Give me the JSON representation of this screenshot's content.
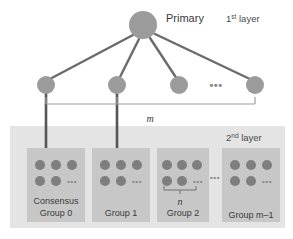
{
  "figure": {
    "title_label": "Primary",
    "layer1_label": "1",
    "layer1_sup": "st",
    "layer1_suffix": " layer",
    "layer2_label": "2",
    "layer2_sup": "nd",
    "layer2_suffix": " layer",
    "m_label": "m",
    "n_label": "n",
    "ellipsis": "•••",
    "ellipsis_small": "•••"
  },
  "colors": {
    "node_fill": "#9a9a9a",
    "node_stroke": "#8a8a8a",
    "edge": "#6b6b6b",
    "trunk": "#5a5a5a",
    "bracket": "#9a9a9a",
    "band_bg": "#e3e3e3",
    "group_bg": "#c6c6c6",
    "dot_fill": "#7e7e7e",
    "text": "#3a3a3a",
    "page_bg": "#ffffff"
  },
  "layer1": {
    "primary": {
      "label": "Primary",
      "cx": 143,
      "cy": 25,
      "r": 14
    },
    "nodes": [
      {
        "name": "node-0",
        "cx": 46,
        "cy": 85,
        "r": 9
      },
      {
        "name": "node-1",
        "cx": 117,
        "cy": 85,
        "r": 9
      },
      {
        "name": "node-2",
        "cx": 179,
        "cy": 85,
        "r": 9
      },
      {
        "name": "node-3",
        "cx": 255,
        "cy": 85,
        "r": 9
      }
    ],
    "ellipsis_x": 216,
    "ellipsis_y": 88
  },
  "layer2": {
    "band": {
      "x": 10,
      "y": 126,
      "w": 275,
      "h": 102
    },
    "groups": [
      {
        "name": "group-0",
        "x": 27,
        "y": 148,
        "w": 58,
        "h": 74,
        "label_lines": [
          "Consensus",
          "Group 0"
        ],
        "row1_dots": 3,
        "row2_dots": 2,
        "has_trunk": true,
        "trunk_x": 46,
        "has_n_brace": false
      },
      {
        "name": "group-1",
        "x": 92,
        "y": 148,
        "w": 58,
        "h": 74,
        "label_lines": [
          "Group 1"
        ],
        "row1_dots": 3,
        "row2_dots": 2,
        "has_trunk": true,
        "trunk_x": 117,
        "has_n_brace": false
      },
      {
        "name": "group-2",
        "x": 157,
        "y": 148,
        "w": 52,
        "h": 74,
        "label_lines": [
          "Group 2"
        ],
        "row1_dots": 3,
        "row2_dots": 2,
        "has_trunk": false,
        "trunk_x": 0,
        "has_n_brace": true
      },
      {
        "name": "group-m-1",
        "x": 222,
        "y": 148,
        "w": 58,
        "h": 74,
        "label_lines": [
          "Group m–1"
        ],
        "row1_dots": 3,
        "row2_dots": 2,
        "has_trunk": false,
        "trunk_x": 0,
        "has_n_brace": false
      }
    ],
    "ellipsis_between_x": 214,
    "ellipsis_between_y": 186
  },
  "m_bracket": {
    "x1": 46,
    "x2": 255,
    "y": 104,
    "tick": 7,
    "mid_tick_x": 117,
    "label": "m",
    "label_x": 150,
    "label_y": 122
  },
  "n_brace": {
    "x1": 164,
    "x2": 196,
    "y": 189,
    "tick": 4,
    "label": "n",
    "label_x": 180,
    "label_y": 203
  },
  "labels": {
    "primary_x": 166,
    "primary_y": 22,
    "layer1_x": 226,
    "layer1_y": 22,
    "layer2_x": 226,
    "layer2_y": 140
  }
}
